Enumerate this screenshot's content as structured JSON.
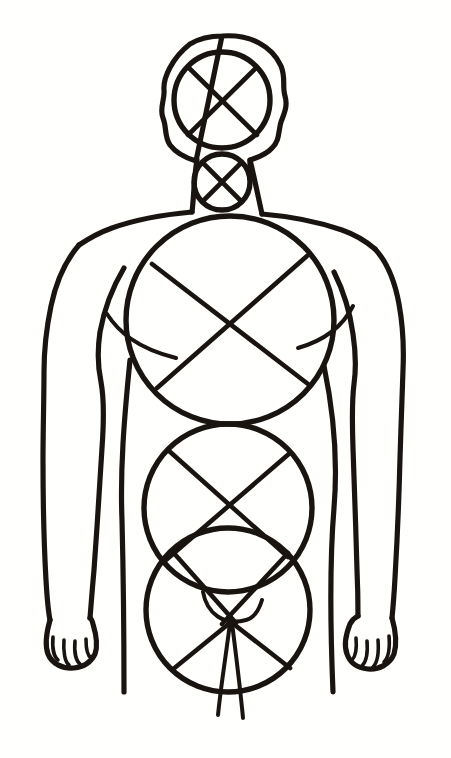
{
  "document": {
    "title": "Human Figure Construction Sketch",
    "medium": "ink line drawing on white paper",
    "view": "anterior / front view",
    "subject": "torso mannequin built from circles with cross-axis guides",
    "background_color": "#fffffd",
    "ink_color": "#1a1411",
    "canvas": {
      "width": 451,
      "height": 758
    }
  },
  "figure": {
    "name": "figure-construction-diagram",
    "parts": [
      {
        "id": "skull-outline",
        "label": "Skull outline",
        "shape": "irregular oval",
        "cx": 224,
        "cy": 100,
        "rx": 60,
        "ry": 64
      },
      {
        "id": "cranium-circle",
        "label": "Cranium circle",
        "shape": "circle",
        "cx": 222,
        "cy": 100,
        "r": 48
      },
      {
        "id": "cranium-cross",
        "label": "Cranium cross axis",
        "shape": "x-cross"
      },
      {
        "id": "jaw-circle",
        "label": "Jaw circle",
        "shape": "circle",
        "cx": 222,
        "cy": 182,
        "r": 28
      },
      {
        "id": "jaw-cross",
        "label": "Jaw cross axis",
        "shape": "x-cross"
      },
      {
        "id": "neck",
        "label": "Neck",
        "shape": "two-lines"
      },
      {
        "id": "chest-circle",
        "label": "Rib cage circle",
        "shape": "circle",
        "cx": 230,
        "cy": 320,
        "r": 104
      },
      {
        "id": "chest-cross",
        "label": "Rib cage cross axis",
        "shape": "x-cross"
      },
      {
        "id": "pectoral-arc-left",
        "label": "Left pectoral arc",
        "shape": "arc"
      },
      {
        "id": "pectoral-arc-right",
        "label": "Right pectoral arc",
        "shape": "arc"
      },
      {
        "id": "abdomen-circle",
        "label": "Abdomen circle",
        "shape": "circle",
        "cx": 228,
        "cy": 508,
        "r": 84
      },
      {
        "id": "abdomen-cross",
        "label": "Abdomen cross axis",
        "shape": "x-cross"
      },
      {
        "id": "pelvis-circle",
        "label": "Pelvis circle",
        "shape": "circle",
        "cx": 228,
        "cy": 610,
        "r": 82
      },
      {
        "id": "pelvis-cross",
        "label": "Pelvis cross axis",
        "shape": "x-cross"
      },
      {
        "id": "pelvis-arc",
        "label": "Pubic arc",
        "shape": "arc"
      },
      {
        "id": "shoulder-left",
        "label": "Left shoulder / trapezius",
        "shape": "line"
      },
      {
        "id": "shoulder-right",
        "label": "Right shoulder / trapezius",
        "shape": "line"
      },
      {
        "id": "arm-left",
        "label": "Left arm",
        "shape": "outline"
      },
      {
        "id": "arm-right",
        "label": "Right arm",
        "shape": "outline"
      },
      {
        "id": "hand-left",
        "label": "Left hand",
        "shape": "outline",
        "fingers": 4
      },
      {
        "id": "hand-right",
        "label": "Right hand",
        "shape": "outline",
        "fingers": 4
      },
      {
        "id": "torso-left",
        "label": "Left flank contour",
        "shape": "line"
      },
      {
        "id": "torso-right",
        "label": "Right flank contour",
        "shape": "line"
      },
      {
        "id": "leg-divide",
        "label": "Inner leg division lines",
        "shape": "two-lines"
      }
    ],
    "construction_circles_count": 5,
    "cross_axes_count": 5
  }
}
